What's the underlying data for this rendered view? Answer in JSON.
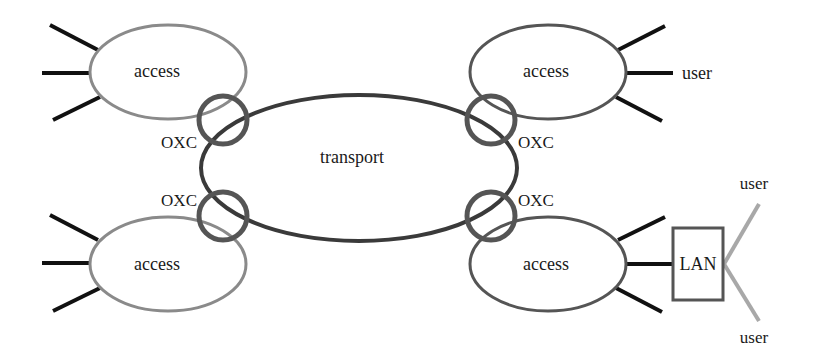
{
  "diagram": {
    "transport": {
      "label": "transport"
    },
    "access_nets": [
      {
        "id": "top-left",
        "label": "access"
      },
      {
        "id": "top-right",
        "label": "access"
      },
      {
        "id": "bottom-left",
        "label": "access"
      },
      {
        "id": "bottom-right",
        "label": "access"
      }
    ],
    "oxc_nodes": [
      {
        "id": "top-left",
        "label": "OXC"
      },
      {
        "id": "top-right",
        "label": "OXC"
      },
      {
        "id": "bottom-left",
        "label": "OXC"
      },
      {
        "id": "bottom-right",
        "label": "OXC"
      }
    ],
    "users": [
      {
        "id": "top-right-user",
        "label": "user"
      },
      {
        "id": "lan-user-top",
        "label": "user"
      },
      {
        "id": "lan-user-bottom",
        "label": "user"
      }
    ],
    "lan": {
      "label": "LAN"
    },
    "colors": {
      "transport_stroke": "#3a3a3a",
      "oxc_stroke": "#555555",
      "access_left_stroke": "#8a8a8a",
      "access_right_stroke": "#555555",
      "user_links": "#111111",
      "lan_user_links": "#a8a8a8"
    }
  }
}
